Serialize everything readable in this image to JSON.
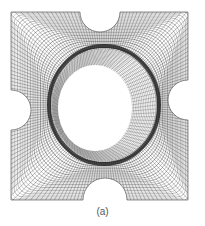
{
  "figure": {
    "caption": "(a)",
    "colors": {
      "background": "#ffffff",
      "mesh_dark": "#1a1a1a",
      "mesh_light": "#6e6e6e",
      "caption_text": "#555555"
    }
  }
}
